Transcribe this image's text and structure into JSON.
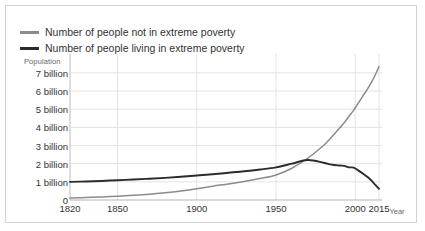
{
  "legend": {
    "items": [
      {
        "label": "Number of people not in extreme poverty",
        "color": "#8c8c8c",
        "key": "not_in_poverty"
      },
      {
        "label": "Number of people living in extreme poverty",
        "color": "#2b2b2b",
        "key": "in_poverty"
      }
    ]
  },
  "axes": {
    "y_title": "Population",
    "x_title": "Year",
    "y_ticks": [
      "0",
      "1 billion",
      "2 billion",
      "3 billion",
      "4 billion",
      "5 billion",
      "6 billion",
      "7 billion"
    ],
    "x_ticks": [
      "1820",
      "1850",
      "1900",
      "1950",
      "2000",
      "2015"
    ]
  },
  "chart_data": {
    "type": "line",
    "title": "",
    "subtitle": "",
    "xlabel": "Year",
    "ylabel": "Population",
    "xlim": [
      1820,
      2015
    ],
    "ylim": [
      0,
      7.6
    ],
    "y_unit": "billion",
    "grid": true,
    "legend_position": "top-left",
    "x_tick_values": [
      1820,
      1850,
      1900,
      1950,
      2000,
      2015
    ],
    "y_tick_values": [
      0,
      1,
      2,
      3,
      4,
      5,
      6,
      7
    ],
    "x": [
      1820,
      1830,
      1840,
      1850,
      1860,
      1870,
      1880,
      1890,
      1900,
      1910,
      1920,
      1930,
      1940,
      1950,
      1960,
      1970,
      1980,
      1985,
      1990,
      1993,
      1996,
      1999,
      2002,
      2005,
      2008,
      2011,
      2013,
      2015
    ],
    "series": [
      {
        "name": "Number of people not in extreme poverty",
        "color": "#8c8c8c",
        "values": [
          0.11,
          0.14,
          0.17,
          0.21,
          0.26,
          0.32,
          0.4,
          0.5,
          0.62,
          0.76,
          0.88,
          1.02,
          1.18,
          1.38,
          1.75,
          2.3,
          3.0,
          3.45,
          3.95,
          4.25,
          4.6,
          4.95,
          5.35,
          5.75,
          6.15,
          6.6,
          6.95,
          7.35
        ]
      },
      {
        "name": "Number of people living in extreme poverty",
        "color": "#2b2b2b",
        "values": [
          1.0,
          1.02,
          1.05,
          1.09,
          1.13,
          1.17,
          1.22,
          1.28,
          1.35,
          1.42,
          1.5,
          1.58,
          1.68,
          1.8,
          2.0,
          2.2,
          2.05,
          1.95,
          1.9,
          1.88,
          1.8,
          1.78,
          1.62,
          1.45,
          1.25,
          1.0,
          0.8,
          0.62
        ]
      }
    ]
  }
}
